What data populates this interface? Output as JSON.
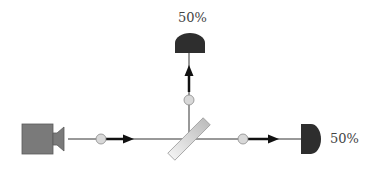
{
  "diagram": {
    "type": "beam-splitter-experiment",
    "colors": {
      "background": "#ffffff",
      "source": "#7a7a7a",
      "source_stroke": "#5a5a5a",
      "detector": "#2e2e2e",
      "beam_line": "#333333",
      "arrow": "#111111",
      "photon_fill": "#d8d8d8",
      "photon_stroke": "#8a8a8a",
      "splitter_light": "#eeeeee",
      "splitter_dark": "#bdbdbd",
      "splitter_stroke": "#9a9a9a",
      "label": "#444444"
    },
    "source": {
      "name": "light-source",
      "icon": "camera-icon"
    },
    "beam_splitter": {
      "name": "beam-splitter",
      "angle_deg": -45
    },
    "detectors": [
      {
        "id": "top",
        "name": "detector-transmitted-up",
        "label": "50%"
      },
      {
        "id": "right",
        "name": "detector-right",
        "label": "50%"
      }
    ],
    "photons": [
      {
        "id": "incoming",
        "x": 101,
        "y": 139
      },
      {
        "id": "up",
        "x": 189,
        "y": 100
      },
      {
        "id": "right",
        "x": 243,
        "y": 139
      }
    ]
  }
}
